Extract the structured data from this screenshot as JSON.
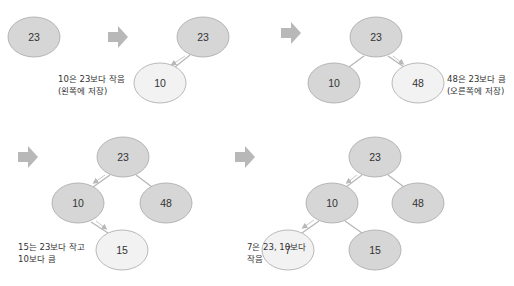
{
  "colors": {
    "node_dark": "#d6d6d6",
    "node_light": "#f2f2f2",
    "node_stroke": "#a8a8a8",
    "edge": "#b5b5b5",
    "arrow": "#b8b8b8",
    "text": "#333333"
  },
  "panels": [
    {
      "id": "step1",
      "nodes": [
        {
          "value": "23",
          "state": "existing"
        }
      ]
    },
    {
      "id": "step2",
      "nodes": [
        {
          "value": "23",
          "state": "existing"
        },
        {
          "value": "10",
          "state": "new"
        }
      ],
      "caption": [
        "10은 23보다 작음",
        "(왼쪽에 저장)"
      ]
    },
    {
      "id": "step3",
      "nodes": [
        {
          "value": "23",
          "state": "existing"
        },
        {
          "value": "10",
          "state": "existing"
        },
        {
          "value": "48",
          "state": "new"
        }
      ],
      "caption": [
        "48은 23보다 큼",
        "(오른쪽에 저장)"
      ]
    },
    {
      "id": "step4",
      "nodes": [
        {
          "value": "23",
          "state": "existing"
        },
        {
          "value": "10",
          "state": "existing"
        },
        {
          "value": "48",
          "state": "existing"
        },
        {
          "value": "15",
          "state": "new"
        }
      ],
      "caption": [
        "15는 23보다 작고",
        "10보다 큼"
      ]
    },
    {
      "id": "step5",
      "nodes": [
        {
          "value": "23",
          "state": "existing"
        },
        {
          "value": "10",
          "state": "existing"
        },
        {
          "value": "48",
          "state": "existing"
        },
        {
          "value": "7",
          "state": "new"
        },
        {
          "value": "15",
          "state": "existing"
        }
      ],
      "caption": [
        "7은 23, 10보다",
        "작음"
      ]
    }
  ],
  "captions": {
    "step2": "10은 23보다 작음\n(왼쪽에 저장)",
    "step3": "48은 23보다 큼\n(오른쪽에 저장)",
    "step4": "15는 23보다 작고\n10보다 큼",
    "step5": "7은 23, 10보다\n작음"
  },
  "labels": {
    "n23": "23",
    "n10": "10",
    "n48": "48",
    "n15": "15",
    "n7": "7"
  },
  "icons": {
    "step_arrow": "right-arrow-icon"
  }
}
